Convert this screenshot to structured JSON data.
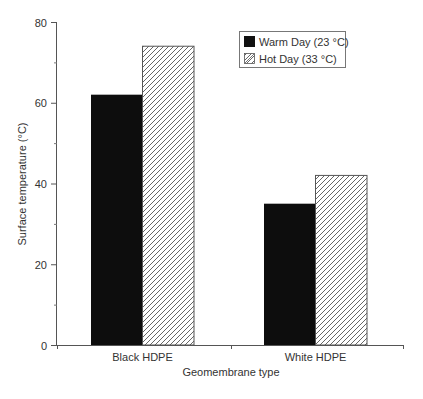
{
  "chart_data": {
    "type": "bar",
    "title": "",
    "xlabel": "Geomembrane type",
    "ylabel": "Surface temperature (°C)",
    "categories": [
      "Black HDPE",
      "White HDPE"
    ],
    "series": [
      {
        "name": "Warm Day (23 °C)",
        "values": [
          62,
          35
        ],
        "fill": "solid",
        "color": "#000000"
      },
      {
        "name": "Hot Day (33 °C)",
        "values": [
          74,
          42
        ],
        "fill": "hatch",
        "color": "#ffffff"
      }
    ],
    "ylim": [
      0,
      80
    ],
    "yticks": [
      0,
      20,
      40,
      60,
      80
    ],
    "yticks_minor": [
      10,
      30,
      50,
      70
    ],
    "grid": false,
    "legend_position": "upper-right"
  }
}
